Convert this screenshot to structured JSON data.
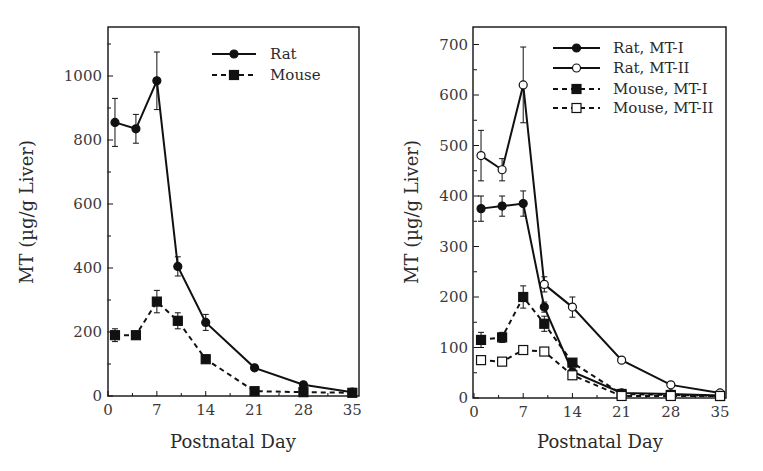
{
  "chart_data": [
    {
      "type": "line",
      "panel": "left",
      "title": "",
      "xlabel": "Postnatal Day",
      "ylabel": "MT (µg/g Liver)",
      "xlim": [
        0,
        35
      ],
      "ylim": [
        0,
        1150
      ],
      "xticks": [
        0,
        7,
        14,
        21,
        28,
        35
      ],
      "yticks": [
        0,
        200,
        400,
        600,
        800,
        1000
      ],
      "grid": false,
      "legend_position": "upper right",
      "x": [
        1,
        4,
        7,
        10,
        14,
        21,
        28,
        35
      ],
      "series": [
        {
          "name": "Rat",
          "style": "solid",
          "marker": "filled-circle",
          "values": [
            855,
            835,
            985,
            405,
            230,
            88,
            35,
            12
          ],
          "errors": [
            75,
            45,
            90,
            30,
            25,
            5,
            4,
            2
          ]
        },
        {
          "name": "Mouse",
          "style": "dashed",
          "marker": "filled-square",
          "values": [
            190,
            190,
            295,
            235,
            115,
            15,
            12,
            10
          ],
          "errors": [
            20,
            12,
            35,
            25,
            10,
            3,
            2,
            2
          ]
        }
      ]
    },
    {
      "type": "line",
      "panel": "right",
      "title": "",
      "xlabel": "Postnatal Day",
      "ylabel": "MT (µg/g Liver)",
      "xlim": [
        0,
        35
      ],
      "ylim": [
        0,
        735
      ],
      "xticks": [
        0,
        7,
        14,
        21,
        28,
        35
      ],
      "yticks": [
        0,
        100,
        200,
        300,
        400,
        500,
        600,
        700
      ],
      "grid": false,
      "legend_position": "upper right",
      "x": [
        1,
        4,
        7,
        10,
        14,
        21,
        28,
        35
      ],
      "series": [
        {
          "name": "Rat, MT-I",
          "style": "solid",
          "marker": "filled-circle",
          "values": [
            375,
            380,
            385,
            180,
            52,
            10,
            8,
            5
          ],
          "errors": [
            25,
            20,
            25,
            10,
            5,
            2,
            2,
            1
          ]
        },
        {
          "name": "Rat, MT-II",
          "style": "solid",
          "marker": "open-circle",
          "values": [
            480,
            452,
            620,
            225,
            180,
            75,
            26,
            10
          ],
          "errors": [
            50,
            22,
            75,
            15,
            20,
            4,
            3,
            2
          ]
        },
        {
          "name": "Mouse, MT-I",
          "style": "dashed",
          "marker": "filled-square",
          "values": [
            115,
            120,
            200,
            147,
            70,
            8,
            6,
            4
          ],
          "errors": [
            15,
            10,
            22,
            15,
            6,
            2,
            2,
            1
          ]
        },
        {
          "name": "Mouse, MT-II",
          "style": "dashed",
          "marker": "open-square",
          "values": [
            75,
            72,
            95,
            92,
            45,
            4,
            4,
            4
          ],
          "errors": [
            5,
            4,
            5,
            6,
            4,
            1,
            1,
            1
          ]
        }
      ]
    }
  ],
  "panels": {
    "left": {
      "xlabel": "Postnatal Day",
      "ylabel": "MT (µg/g Liver)",
      "legend": [
        "Rat",
        "Mouse"
      ]
    },
    "right": {
      "xlabel": "Postnatal Day",
      "ylabel": "MT (µg/g Liver)",
      "legend": [
        "Rat, MT-I",
        "Rat, MT-II",
        "Mouse, MT-I",
        "Mouse, MT-II"
      ]
    }
  },
  "colors": {
    "ink": "#111111",
    "text": "#2a2a2a",
    "background": "#ffffff"
  }
}
